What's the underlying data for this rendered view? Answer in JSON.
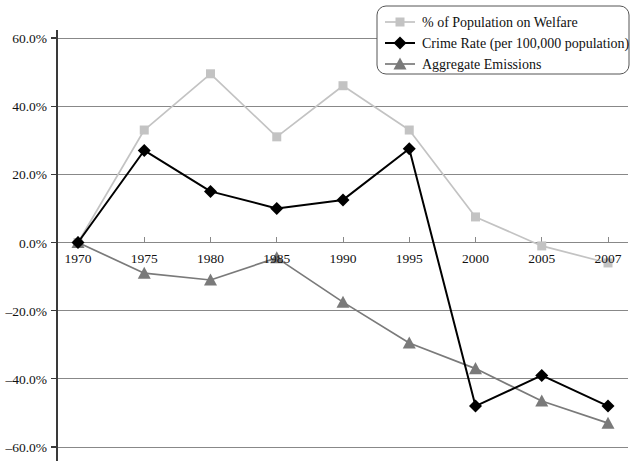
{
  "chart_data": {
    "type": "line",
    "title": "",
    "subtitle": "",
    "xlabel": "",
    "ylabel": "",
    "grid": true,
    "legend_position": "top-right",
    "ylim": [
      -60,
      60
    ],
    "ytick_values": [
      60,
      40,
      20,
      0,
      -20,
      -40,
      -60
    ],
    "ytick_labels": [
      "60.0%",
      "40.0%",
      "20.0%",
      "0.0%",
      "–20.0%",
      "–40.0%",
      "–60.0%"
    ],
    "categories": [
      "1970",
      "1975",
      "1980",
      "1985",
      "1990",
      "1995",
      "2000",
      "2005",
      "2007"
    ],
    "x": [
      1970,
      1975,
      1980,
      1985,
      1990,
      1995,
      2000,
      2005,
      2007
    ],
    "series": [
      {
        "name": "% of Population on Welfare",
        "color": "#c3c3c3",
        "marker": "square",
        "values": [
          0.0,
          33.0,
          49.5,
          31.0,
          46.0,
          33.0,
          7.5,
          -1.0,
          -6.0
        ]
      },
      {
        "name": "Crime Rate (per 100,000 population)",
        "color": "#000000",
        "marker": "diamond",
        "values": [
          0.0,
          27.0,
          15.0,
          10.0,
          12.5,
          27.5,
          -48.0,
          -39.0,
          -48.0
        ]
      },
      {
        "name": "Aggregate Emissions",
        "color": "#7a7a7a",
        "marker": "triangle",
        "values": [
          0.0,
          -9.0,
          -11.0,
          -4.5,
          -17.5,
          -29.5,
          -37.0,
          -46.5,
          -53.0
        ]
      }
    ]
  },
  "axes": {
    "y_tick_labels": [
      "60.0%",
      "40.0%",
      "20.0%",
      "0.0%",
      "–20.0%",
      "–40.0%",
      "–60.0%"
    ],
    "x_tick_labels": [
      "1970",
      "1975",
      "1980",
      "1985",
      "1990",
      "1995",
      "2000",
      "2005",
      "2007"
    ]
  },
  "legend": {
    "items": [
      {
        "label": "% of Population on Welfare",
        "color": "#c3c3c3",
        "marker": "square"
      },
      {
        "label": "Crime Rate (per 100,000 population)",
        "color": "#000000",
        "marker": "diamond"
      },
      {
        "label": "Aggregate Emissions",
        "color": "#7a7a7a",
        "marker": "triangle"
      }
    ]
  },
  "colors": {
    "axis": "#3a3a3a",
    "grid": "#888888",
    "background": "#ffffff",
    "legend_border": "#555555",
    "text": "#111111"
  }
}
